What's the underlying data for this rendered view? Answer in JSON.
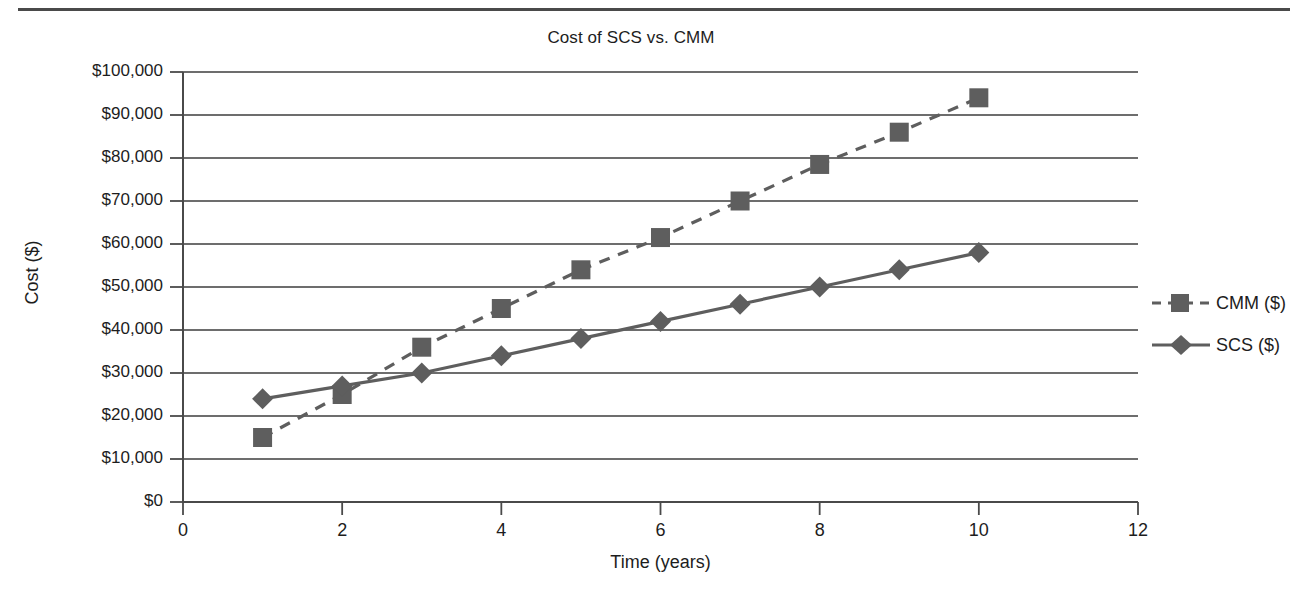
{
  "chart_data": {
    "type": "line",
    "title": "Cost of SCS vs. CMM",
    "xlabel": "Time (years)",
    "ylabel": "Cost ($)",
    "xlim": [
      0,
      12
    ],
    "ylim": [
      0,
      100000
    ],
    "x": [
      1,
      2,
      3,
      4,
      5,
      6,
      7,
      8,
      9,
      10
    ],
    "xticks": [
      0,
      2,
      4,
      6,
      8,
      10,
      12
    ],
    "xtick_labels": [
      "0",
      "2",
      "4",
      "6",
      "8",
      "10",
      "12"
    ],
    "yticks": [
      0,
      10000,
      20000,
      30000,
      40000,
      50000,
      60000,
      70000,
      80000,
      90000,
      100000
    ],
    "ytick_labels": [
      "$0",
      "$10,000",
      "$20,000",
      "$30,000",
      "$40,000",
      "$50,000",
      "$60,000",
      "$70,000",
      "$80,000",
      "$90,000",
      "$100,000"
    ],
    "grid": "horizontal",
    "legend_position": "right",
    "series": [
      {
        "name": "CMM ($)",
        "marker": "square",
        "linestyle": "dashed",
        "color": "#5e5e5e",
        "values": [
          15000,
          25000,
          36000,
          45000,
          54000,
          61500,
          70000,
          78500,
          86000,
          94000
        ]
      },
      {
        "name": "SCS ($)",
        "marker": "diamond",
        "linestyle": "solid",
        "color": "#5e5e5e",
        "values": [
          24000,
          27000,
          30000,
          34000,
          38000,
          42000,
          46000,
          50000,
          54000,
          58000
        ]
      }
    ]
  },
  "legend": {
    "items": [
      {
        "label": "CMM ($)"
      },
      {
        "label": "SCS ($)"
      }
    ]
  },
  "colors": {
    "axis": "#4a4a4a",
    "grid": "#3c3c3c",
    "series": "#5e5e5e",
    "text": "#1d1d1d",
    "background": "#ffffff"
  }
}
